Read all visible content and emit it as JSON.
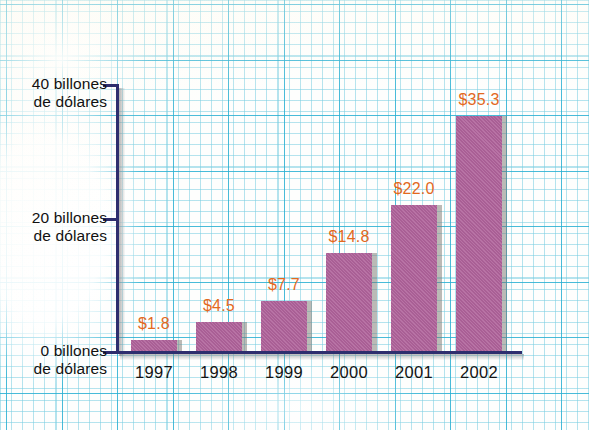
{
  "chart_data": {
    "type": "bar",
    "title": "",
    "subtitle": "",
    "xlabel": "",
    "ylabel": "billones de dólares",
    "categories": [
      "1997",
      "1998",
      "1999",
      "2000",
      "2001",
      "2002"
    ],
    "values": [
      1.8,
      4.5,
      7.7,
      14.8,
      22.0,
      35.3
    ],
    "value_labels": [
      "$1.8",
      "$4.5",
      "$7.7",
      "$14.8",
      "$22.0",
      "$35.3"
    ],
    "ylim": [
      0,
      40
    ],
    "yticks": [
      0,
      20,
      40
    ],
    "ytick_labels": [
      {
        "line1": "40 billones",
        "line2": "de dólares",
        "value": 40
      },
      {
        "line1": "20 billones",
        "line2": "de dólares",
        "value": 20
      },
      {
        "line1": "0 billones",
        "line2": "de dólares",
        "value": 0
      }
    ],
    "grid": true,
    "grid_style": "graph-paper",
    "legend": false,
    "legend_position": "none",
    "annotations": [],
    "colors": {
      "bar": "#b0639b",
      "bar_shadow": "#78766f",
      "value_label": "#e2691e",
      "axis": "#2e2e6e",
      "tick_label": "#141414",
      "grid_minor": "#78cde1",
      "grid_major": "#28afd2",
      "background": "#fefefd"
    }
  },
  "series": [
    {
      "category": "1997",
      "value": 1.8,
      "label": "$1.8"
    },
    {
      "category": "1998",
      "value": 4.5,
      "label": "$4.5"
    },
    {
      "category": "1999",
      "value": 7.7,
      "label": "$7.7"
    },
    {
      "category": "2000",
      "value": 14.8,
      "label": "$14.8"
    },
    {
      "category": "2001",
      "value": 22.0,
      "label": "$22.0"
    },
    {
      "category": "2002",
      "value": 35.3,
      "label": "$35.3"
    }
  ]
}
